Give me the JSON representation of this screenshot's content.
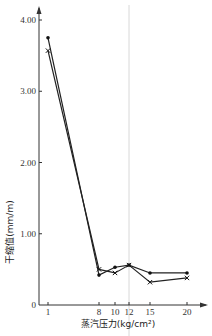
{
  "chart_data": {
    "type": "line",
    "title": "",
    "xlabel": "蒸汽压力(kg/cm²)",
    "ylabel": "干缩值(mm/m)",
    "x": [
      1,
      8,
      10,
      12,
      15,
      20
    ],
    "x_ticks": [
      "1",
      "8",
      "10",
      "12",
      "15",
      "20"
    ],
    "y_ticks": [
      "0",
      "1.00",
      "2.00",
      "3.00",
      "4.00"
    ],
    "ylim": [
      0,
      4.1
    ],
    "grid": false,
    "legend": null,
    "series": [
      {
        "name": "series-dot",
        "marker": "dot",
        "values": [
          3.75,
          0.42,
          0.53,
          0.56,
          0.45,
          0.45
        ]
      },
      {
        "name": "series-cross",
        "marker": "cross",
        "values": [
          3.57,
          0.5,
          0.45,
          0.56,
          0.32,
          0.38
        ]
      }
    ],
    "annotations": [
      {
        "type": "vertical-line",
        "x": 12,
        "color": "#d8d8d8"
      }
    ]
  }
}
